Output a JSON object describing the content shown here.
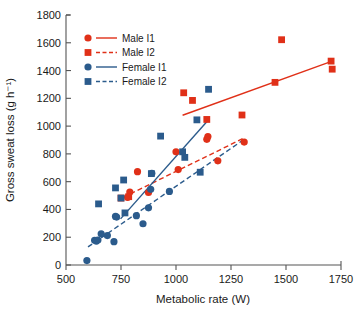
{
  "chart_data": {
    "type": "scatter",
    "title": "",
    "xlabel": "Metabolic rate (W)",
    "ylabel": "Gross sweat loss (g h⁻¹)",
    "xlim": [
      500,
      1750
    ],
    "ylim": [
      0,
      1800
    ],
    "xticks": [
      500,
      750,
      1000,
      1250,
      1500,
      1750
    ],
    "yticks": [
      0,
      200,
      400,
      600,
      800,
      1000,
      1200,
      1400,
      1600,
      1800
    ],
    "xtick_labels": [
      "500",
      "750",
      "1000",
      "1250",
      "1500",
      "1750"
    ],
    "ytick_labels": [
      "0",
      "200",
      "400",
      "600",
      "800",
      "1000",
      "1200",
      "1400",
      "1600",
      "1800"
    ],
    "grid": false,
    "legend_position": "upper-left",
    "colors": {
      "male": "#E03018",
      "female": "#2B5B8C"
    },
    "series": [
      {
        "name": "Male I1",
        "marker": "circle",
        "line_style": "solid",
        "color": "#E03018",
        "points": [
          [
            780,
            487
          ],
          [
            790,
            525
          ],
          [
            825,
            672
          ],
          [
            875,
            522
          ],
          [
            1000,
            815
          ],
          [
            1010,
            687
          ],
          [
            1140,
            905
          ],
          [
            1145,
            925
          ],
          [
            1190,
            750
          ],
          [
            1310,
            885
          ]
        ],
        "fit_line": [
          [
            1030,
            1078
          ],
          [
            1710,
            1468
          ]
        ]
      },
      {
        "name": "Male I2",
        "marker": "square",
        "line_style": "dashed",
        "color": "#E03018",
        "points": [
          [
            750,
            482
          ],
          [
            785,
            492
          ],
          [
            1035,
            1240
          ],
          [
            1075,
            1185
          ],
          [
            1140,
            1048
          ],
          [
            1300,
            1080
          ],
          [
            1480,
            1622
          ],
          [
            1450,
            1315
          ],
          [
            1705,
            1468
          ],
          [
            1710,
            1410
          ]
        ],
        "fit_line": [
          [
            760,
            487
          ],
          [
            1310,
            915
          ]
        ]
      },
      {
        "name": "Female I1",
        "marker": "circle",
        "line_style": "solid",
        "color": "#2B5B8C",
        "points": [
          [
            595,
            32
          ],
          [
            630,
            178
          ],
          [
            638,
            172
          ],
          [
            645,
            180
          ],
          [
            660,
            225
          ],
          [
            688,
            212
          ],
          [
            718,
            168
          ],
          [
            725,
            350
          ],
          [
            730,
            345
          ],
          [
            820,
            355
          ],
          [
            850,
            297
          ],
          [
            875,
            412
          ],
          [
            885,
            545
          ],
          [
            890,
            660
          ],
          [
            970,
            530
          ]
        ],
        "fit_line": [
          [
            748,
            332
          ],
          [
            1150,
            1050
          ]
        ]
      },
      {
        "name": "Female I2",
        "marker": "square",
        "line_style": "dashed",
        "color": "#2B5B8C",
        "points": [
          [
            648,
            440
          ],
          [
            725,
            555
          ],
          [
            750,
            482
          ],
          [
            762,
            612
          ],
          [
            768,
            375
          ],
          [
            888,
            658
          ],
          [
            930,
            928
          ],
          [
            1030,
            815
          ],
          [
            1040,
            775
          ],
          [
            1095,
            1045
          ],
          [
            1110,
            668
          ],
          [
            1148,
            1265
          ]
        ],
        "fit_line": [
          [
            600,
            130
          ],
          [
            1310,
            905
          ]
        ]
      }
    ]
  },
  "legend": {
    "items": [
      {
        "label": "Male I1"
      },
      {
        "label": "Male I2"
      },
      {
        "label": "Female I1"
      },
      {
        "label": "Female I2"
      }
    ]
  }
}
